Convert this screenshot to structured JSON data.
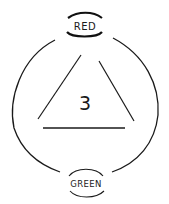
{
  "diagram": {
    "top_label": "RED",
    "bottom_label": "GREEN",
    "center_value": "3",
    "stroke_color": "#1a1a1a",
    "background": "#ffffff"
  }
}
